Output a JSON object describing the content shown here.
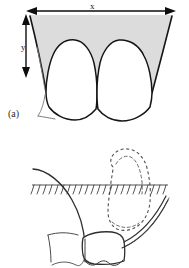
{
  "figure": {
    "panels": [
      {
        "id": "a",
        "label": "(a)",
        "view": "frontal view of maxillary central incisors with shaded gingival/lip region",
        "annotations": [
          {
            "name": "x",
            "label": "x",
            "meaning": "horizontal width dimension",
            "arrow": "double-headed-horizontal"
          },
          {
            "name": "y",
            "label": "y",
            "meaning": "vertical height dimension",
            "arrow": "double-headed-vertical"
          }
        ],
        "shaded_region_color": "#d9d9d9",
        "outline_color": "#1a1a1a"
      },
      {
        "id": "b",
        "label": "(b)",
        "view": "lateral profile view with dashed nasal outline and hatched reference line",
        "annotations": [],
        "dashed_outline_color": "#555555",
        "outline_color": "#333333",
        "hatch_line_color": "#444444"
      }
    ]
  },
  "labels": {
    "panel_a": "(a)",
    "panel_b": "(b)",
    "dim_x": "x",
    "dim_y": "y"
  },
  "colors": {
    "background": "#ffffff",
    "ink": "#1a1a1a",
    "shade": "#d9d9d9",
    "dashed": "#555555"
  }
}
